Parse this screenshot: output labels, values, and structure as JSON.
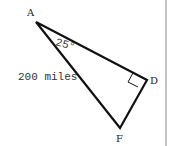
{
  "diagram": {
    "type": "right-triangle",
    "vertices": {
      "A": {
        "label": "A",
        "x": 36,
        "y": 22
      },
      "D": {
        "label": "D",
        "x": 147,
        "y": 80
      },
      "F": {
        "label": "F",
        "x": 120,
        "y": 128
      }
    },
    "angle_label": "25°",
    "side_label": "200 miles",
    "right_angle_at": "D",
    "colors": {
      "stroke": "#111111",
      "text": "#222222",
      "border": "#888888"
    }
  }
}
